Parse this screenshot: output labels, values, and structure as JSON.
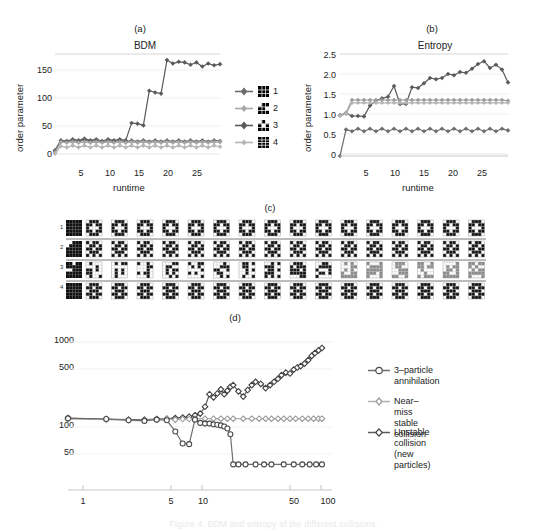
{
  "figure": {
    "caption": "Figure 4. BDM and entropy of the different collisions."
  },
  "panel_a": {
    "tag": "(a)",
    "title": "BDM",
    "xlabel": "runtime",
    "ylabel": "order parameter",
    "yticks": [
      "0",
      "50",
      "100",
      "150"
    ],
    "xticks": [
      "5",
      "10",
      "15",
      "20",
      "25"
    ],
    "legend": [
      {
        "label": "1",
        "color": "#6b6b6b"
      },
      {
        "label": "2",
        "color": "#a8a8a8"
      },
      {
        "label": "3",
        "color": "#5a5a5a"
      },
      {
        "label": "4",
        "color": "#b5b5b5"
      }
    ]
  },
  "panel_b": {
    "tag": "(b)",
    "title": "Entropy",
    "xlabel": "runtime",
    "ylabel": "order parameter",
    "yticks": [
      "0",
      "0.5",
      "1.0",
      "1.5",
      "2.0",
      "2.5"
    ],
    "xticks": [
      "5",
      "10",
      "15",
      "20",
      "25"
    ]
  },
  "panel_c": {
    "tag": "(c)",
    "row_labels": [
      "1",
      "2",
      "3",
      "4"
    ]
  },
  "panel_d": {
    "tag": "(d)",
    "yticks": [
      "50",
      "100",
      "500",
      "1000"
    ],
    "xticks": [
      "1",
      "5",
      "10",
      "50",
      "100"
    ],
    "legend": [
      {
        "label": "3–particle\nannihilation",
        "color": "#6e6e6e"
      },
      {
        "label": "Near–miss\nstable collision",
        "color": "#b0b0b0"
      },
      {
        "label": "Unstable collision\n(new particles)",
        "color": "#5c5c5c"
      }
    ]
  },
  "chart_data": [
    {
      "type": "line",
      "panel": "(a)",
      "title": "BDM",
      "xlabel": "runtime",
      "ylabel": "order parameter",
      "xlim": [
        1,
        29
      ],
      "ylim": [
        0,
        180
      ],
      "yticks": [
        0,
        50,
        100,
        150
      ],
      "xticks": [
        5,
        10,
        15,
        20,
        25
      ],
      "grid": true,
      "legend_position": "right",
      "series": [
        {
          "name": "3",
          "color": "#5a5a5a",
          "x": [
            1,
            2,
            3,
            4,
            5,
            6,
            7,
            8,
            9,
            10,
            11,
            12,
            13,
            14,
            15,
            16,
            17,
            18,
            19,
            20,
            21,
            22,
            23,
            24,
            25,
            26,
            27,
            28,
            29
          ],
          "values": [
            10,
            27,
            26,
            29,
            27,
            30,
            27,
            29,
            26,
            29,
            27,
            29,
            27,
            57,
            56,
            53,
            113,
            110,
            108,
            166,
            160,
            163,
            162,
            158,
            162,
            155,
            160,
            157,
            159
          ]
        },
        {
          "name": "1",
          "color": "#6b6b6b",
          "x": [
            1,
            2,
            3,
            4,
            5,
            6,
            7,
            8,
            9,
            10,
            11,
            12,
            13,
            14,
            15,
            16,
            17,
            18,
            19,
            20,
            21,
            22,
            23,
            24,
            25,
            26,
            27,
            28,
            29
          ],
          "values": [
            8,
            26,
            25,
            27,
            25,
            28,
            25,
            27,
            25,
            27,
            25,
            27,
            25,
            27,
            25,
            27,
            25,
            27,
            25,
            27,
            25,
            27,
            25,
            27,
            25,
            27,
            25,
            27,
            26
          ]
        },
        {
          "name": "2",
          "color": "#a8a8a8",
          "x": [
            1,
            2,
            3,
            4,
            5,
            6,
            7,
            8,
            9,
            10,
            11,
            12,
            13,
            14,
            15,
            16,
            17,
            18,
            19,
            20,
            21,
            22,
            23,
            24,
            25,
            26,
            27,
            28,
            29
          ],
          "values": [
            6,
            24,
            23,
            24,
            23,
            24,
            23,
            24,
            23,
            24,
            23,
            24,
            23,
            24,
            23,
            24,
            23,
            24,
            23,
            24,
            23,
            24,
            23,
            24,
            23,
            24,
            23,
            24,
            24
          ]
        },
        {
          "name": "4",
          "color": "#b5b5b5",
          "x": [
            1,
            2,
            3,
            4,
            5,
            6,
            7,
            8,
            9,
            10,
            11,
            12,
            13,
            14,
            15,
            16,
            17,
            18,
            19,
            20,
            21,
            22,
            23,
            24,
            25,
            26,
            27,
            28,
            29
          ],
          "values": [
            4,
            17,
            15,
            18,
            15,
            18,
            15,
            18,
            15,
            18,
            15,
            18,
            15,
            18,
            15,
            18,
            15,
            18,
            15,
            18,
            15,
            18,
            15,
            18,
            15,
            18,
            15,
            18,
            16
          ]
        }
      ]
    },
    {
      "type": "line",
      "panel": "(b)",
      "title": "Entropy",
      "xlabel": "runtime",
      "ylabel": "order parameter",
      "xlim": [
        1,
        29
      ],
      "ylim": [
        0,
        2.6
      ],
      "yticks": [
        0,
        0.5,
        1.0,
        1.5,
        2.0,
        2.5
      ],
      "xticks": [
        5,
        10,
        15,
        20,
        25
      ],
      "grid": true,
      "series": [
        {
          "name": "3",
          "color": "#5a5a5a",
          "x": [
            1,
            2,
            3,
            4,
            5,
            6,
            7,
            8,
            9,
            10,
            11,
            12,
            13,
            14,
            15,
            16,
            17,
            18,
            19,
            20,
            21,
            22,
            23,
            24,
            25,
            26,
            27,
            28,
            29
          ],
          "values": [
            1.02,
            1.07,
            1.0,
            1.0,
            0.99,
            1.26,
            1.38,
            1.44,
            1.48,
            1.75,
            1.3,
            1.3,
            1.72,
            1.7,
            1.82,
            1.95,
            1.92,
            1.95,
            2.05,
            2.02,
            2.1,
            2.08,
            2.18,
            2.3,
            2.37,
            2.2,
            2.28,
            2.16,
            1.84
          ]
        },
        {
          "name": "1",
          "color": "#9a9a9a",
          "x": [
            1,
            2,
            3,
            4,
            5,
            6,
            7,
            8,
            9,
            10,
            11,
            12,
            13,
            14,
            15,
            16,
            17,
            18,
            19,
            20,
            21,
            22,
            23,
            24,
            25,
            26,
            27,
            28,
            29
          ],
          "values": [
            1.02,
            1.08,
            1.4,
            1.4,
            1.4,
            1.4,
            1.4,
            1.4,
            1.4,
            1.4,
            1.4,
            1.4,
            1.4,
            1.4,
            1.4,
            1.4,
            1.4,
            1.4,
            1.4,
            1.4,
            1.4,
            1.4,
            1.4,
            1.4,
            1.4,
            1.4,
            1.4,
            1.4,
            1.38
          ]
        },
        {
          "name": "2",
          "color": "#b5b5b5",
          "x": [
            1,
            2,
            3,
            4,
            5,
            6,
            7,
            8,
            9,
            10,
            11,
            12,
            13,
            14,
            15,
            16,
            17,
            18,
            19,
            20,
            21,
            22,
            23,
            24,
            25,
            26,
            27,
            28,
            29
          ],
          "values": [
            1.0,
            1.05,
            1.33,
            1.33,
            1.33,
            1.33,
            1.33,
            1.33,
            1.33,
            1.33,
            1.33,
            1.33,
            1.33,
            1.33,
            1.33,
            1.33,
            1.33,
            1.33,
            1.33,
            1.33,
            1.33,
            1.33,
            1.33,
            1.33,
            1.33,
            1.33,
            1.33,
            1.33,
            1.33
          ]
        },
        {
          "name": "4",
          "color": "#6e6e6e",
          "x": [
            1,
            2,
            3,
            4,
            5,
            6,
            7,
            8,
            9,
            10,
            11,
            12,
            13,
            14,
            15,
            16,
            17,
            18,
            19,
            20,
            21,
            22,
            23,
            24,
            25,
            26,
            27,
            28,
            29
          ],
          "values": [
            0.0,
            0.66,
            0.62,
            0.68,
            0.62,
            0.68,
            0.62,
            0.68,
            0.62,
            0.68,
            0.62,
            0.68,
            0.62,
            0.68,
            0.62,
            0.68,
            0.62,
            0.68,
            0.62,
            0.68,
            0.62,
            0.68,
            0.62,
            0.68,
            0.62,
            0.68,
            0.62,
            0.68,
            0.64
          ]
        },
        {
          "name": "baseline",
          "color": "#c8c8c8",
          "x": [
            1,
            29
          ],
          "values": [
            0.0,
            0.0
          ]
        }
      ]
    },
    {
      "type": "line",
      "panel": "(d)",
      "xscale": "log",
      "yscale": "log",
      "xlim": [
        1,
        120
      ],
      "ylim": [
        18,
        1400
      ],
      "yticks": [
        50,
        100,
        500,
        1000
      ],
      "xticks": [
        1,
        5,
        10,
        50,
        100
      ],
      "legend_position": "right",
      "series": [
        {
          "name": "Unstable collision (new particles)",
          "color": "#5c5c5c",
          "x": [
            1,
            2,
            3,
            4,
            5,
            6,
            7,
            8,
            9,
            10,
            11,
            12,
            13,
            14,
            15,
            16,
            17,
            18,
            19,
            20,
            22,
            24,
            26,
            28,
            30,
            33,
            36,
            39,
            42,
            45,
            48,
            52,
            56,
            60,
            64,
            68,
            73,
            78,
            83,
            88,
            94,
            100
          ],
          "values": [
            115,
            112,
            110,
            110,
            112,
            113,
            115,
            117,
            120,
            125,
            131,
            160,
            230,
            210,
            235,
            265,
            230,
            255,
            285,
            300,
            250,
            215,
            260,
            300,
            330,
            310,
            275,
            300,
            330,
            360,
            400,
            430,
            420,
            470,
            500,
            520,
            560,
            620,
            700,
            760,
            820,
            880
          ]
        },
        {
          "name": "Near–miss stable collision",
          "color": "#b0b0b0",
          "x": [
            1,
            2,
            3,
            4,
            5,
            6,
            7,
            8,
            9,
            10,
            12,
            14,
            16,
            18,
            20,
            24,
            28,
            32,
            36,
            40,
            45,
            50,
            56,
            62,
            70,
            78,
            86,
            94,
            100
          ],
          "values": [
            112,
            110,
            108,
            108,
            110,
            112,
            110,
            112,
            112,
            113,
            113,
            113,
            113,
            113,
            113,
            113,
            113,
            113,
            113,
            113,
            113,
            113,
            113,
            113,
            113,
            113,
            113,
            113,
            113
          ]
        },
        {
          "name": "3–particle annihilation",
          "color": "#6e6e6e",
          "x": [
            1,
            2,
            3,
            4,
            5,
            6,
            7,
            8,
            9,
            10,
            11,
            12,
            13,
            14,
            15,
            16,
            17,
            18,
            19,
            20,
            22,
            25,
            30,
            35,
            40,
            50,
            60,
            70,
            80,
            90,
            100
          ],
          "values": [
            114,
            112,
            108,
            106,
            110,
            108,
            78,
            55,
            54,
            110,
            100,
            98,
            98,
            96,
            95,
            93,
            90,
            85,
            72,
            30,
            30,
            30,
            30,
            30,
            30,
            30,
            30,
            30,
            30,
            30,
            30
          ]
        }
      ]
    }
  ]
}
